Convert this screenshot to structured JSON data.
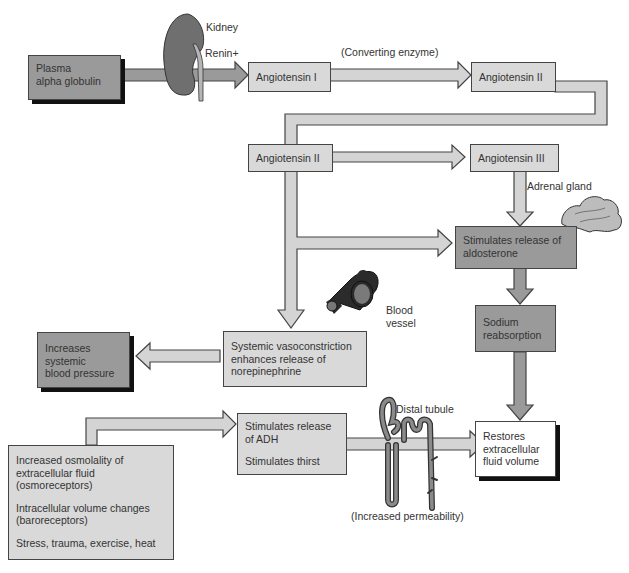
{
  "colors": {
    "arrow_fill": "#d4d4d4",
    "arrow_fill_dark": "#9a9a9a",
    "box_light": "#d9d9d9",
    "box_dark": "#9a9a9a",
    "box_white": "#ffffff",
    "outline": "#444444",
    "shadow": "#111111"
  },
  "nodes": {
    "plasma": {
      "line1": "Plasma",
      "line2": "alpha globulin"
    },
    "angiotensin1": {
      "text": "Angiotensin I"
    },
    "angiotensin2_top": {
      "text": "Angiotensin II"
    },
    "angiotensin2_mid": {
      "text": "Angiotensin II"
    },
    "angiotensin3": {
      "text": "Angiotensin III"
    },
    "aldosterone": {
      "line1": "Stimulates release of",
      "line2": "aldosterone"
    },
    "sodium": {
      "line1": "Sodium",
      "line2": "reabsorption"
    },
    "vasoconstriction": {
      "line1": "Systemic vasoconstriction",
      "line2": "enhances release of",
      "line3": "norepinephrine"
    },
    "blood_pressure": {
      "line1": "Increases",
      "line2": "systemic",
      "line3": "blood pressure"
    },
    "adh": {
      "line1": "Stimulates release",
      "line2": "of ADH",
      "line3": "Stimulates thirst"
    },
    "restores": {
      "line1": "Restores",
      "line2": "extracellular",
      "line3": "fluid volume"
    },
    "stimuli": {
      "item1_line1": "Increased osmolality of",
      "item1_line2": "extracellular fluid",
      "item1_line3": "(osmoreceptors)",
      "item2_line1": "Intracellular volume changes",
      "item2_line2": "(baroreceptors)",
      "item3_line1": "Stress, trauma, exercise, heat"
    }
  },
  "labels": {
    "kidney": "Kidney",
    "renin": "Renin+",
    "converting_enzyme": "(Converting enzyme)",
    "adrenal_gland": "Adrenal gland",
    "blood_vessel_1": "Blood",
    "blood_vessel_2": "vessel",
    "distal_tubule": "Distal tubule",
    "increased_permeability": "(Increased permeability)"
  },
  "icons": [
    "kidney-icon",
    "adrenal-gland-icon",
    "blood-vessel-icon",
    "distal-tubule-icon"
  ]
}
